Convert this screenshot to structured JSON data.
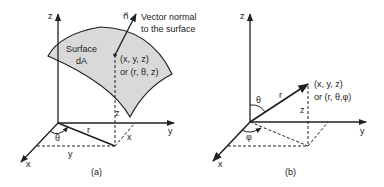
{
  "diagram": {
    "panels": [
      {
        "id": "a",
        "caption": "(a)",
        "axes": {
          "x": "x",
          "y": "y",
          "z": "z"
        },
        "surface_label_line1": "Surface",
        "surface_label_line2": "dA",
        "normal_symbol": "n⃗",
        "normal_label_line1": "Vector normal",
        "normal_label_line2": "to the surface",
        "point_label_line1": "(x, y, z)",
        "point_label_line2": "or (r, θ, z)",
        "angle": "θ",
        "radius": "r",
        "proj_z": "z",
        "proj_x": "x",
        "proj_y": "y"
      },
      {
        "id": "b",
        "caption": "(b)",
        "axes": {
          "x": "x",
          "y": "y",
          "z": "z"
        },
        "point_label_line1": "(x, y, z)",
        "point_label_line2": "or (r, θ,φ)",
        "polar_angle": "θ",
        "azimuth_angle": "φ",
        "radius": "r",
        "proj_z": "z"
      }
    ],
    "colors": {
      "line": "#222222",
      "surface_fill": "#d9d9d9"
    }
  }
}
